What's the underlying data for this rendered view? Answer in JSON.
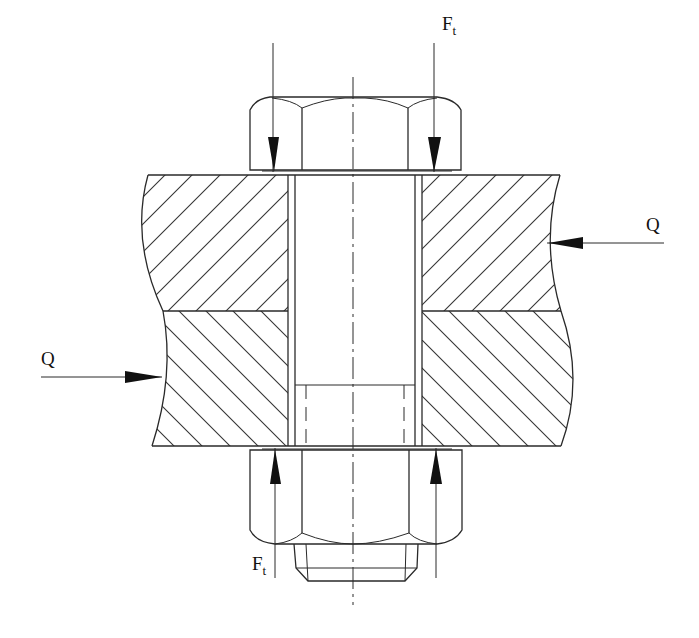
{
  "diagram": {
    "type": "bolted-joint-cross-section",
    "labels": {
      "force_top": "F",
      "force_top_sub": "t",
      "force_bottom": "F",
      "force_bottom_sub": "t",
      "shear_right": "Q",
      "shear_left": "Q"
    },
    "parts": [
      "bolt-head",
      "upper-plate",
      "lower-plate",
      "bolt-shank",
      "nut",
      "centerline"
    ],
    "colors": {
      "line": "#2a2a2a",
      "background": "#ffffff",
      "arrow": "#111111"
    }
  }
}
